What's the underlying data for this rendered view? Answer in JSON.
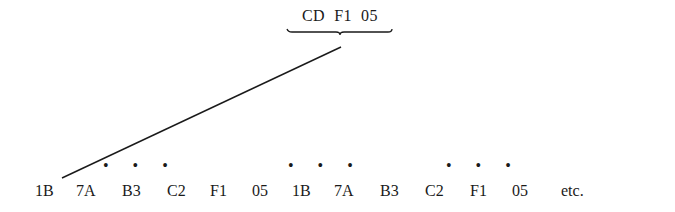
{
  "diagram": {
    "top_label": "CD  F1  05",
    "sequence": [
      {
        "text": "1B",
        "x": 35
      },
      {
        "text": "7A",
        "x": 76
      },
      {
        "text": "B3",
        "x": 122
      },
      {
        "text": "C2",
        "x": 167
      },
      {
        "text": "F1",
        "x": 210
      },
      {
        "text": "05",
        "x": 252
      },
      {
        "text": "1B",
        "x": 292
      },
      {
        "text": "7A",
        "x": 334
      },
      {
        "text": "B3",
        "x": 380
      },
      {
        "text": "C2",
        "x": 425
      },
      {
        "text": "F1",
        "x": 470
      },
      {
        "text": "05",
        "x": 512
      },
      {
        "text": "etc.",
        "x": 561
      }
    ],
    "dot_groups": [
      {
        "text": "• • •",
        "x": 103
      },
      {
        "text": "• • •",
        "x": 288
      },
      {
        "text": "• • •",
        "x": 446
      }
    ],
    "connector": {
      "x1": 62,
      "y1": 178,
      "x2": 341,
      "y2": 47
    },
    "brace": {
      "x_start": 287,
      "x_end": 392,
      "y": 30,
      "tip_x": 340
    },
    "line_color": "#1a1a1a"
  }
}
